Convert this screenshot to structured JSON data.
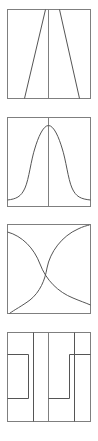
{
  "figure": {
    "background_color": "#ffffff",
    "panel_count": 4,
    "panel_width": 83,
    "panel_height": 89,
    "frame_color": "#7f7f7f",
    "curve_color": "#555555",
    "stroke_width": 1
  },
  "panels": [
    {
      "id": "panel-1",
      "name": "converging-straight-lines",
      "description": "Two straight diagonal lines converging toward the top, forming a narrow V-shaped taper with a vertical center axis",
      "shape_type": "straight-lines",
      "has_center_axis": true,
      "origin_x": 7,
      "origin_y": 9,
      "left_line": {
        "x_top": 38,
        "y_top": 0,
        "x_bottom": 17,
        "y_bottom": 89
      },
      "right_line": {
        "x_top": 52,
        "y_top": 0,
        "x_bottom": 72,
        "y_bottom": 89
      },
      "center_axis_x": 41.5
    },
    {
      "id": "panel-2",
      "name": "gaussian-bell-curve",
      "description": "A symmetric bell-shaped Gaussian curve peaking at the horizontal center near the top of the frame",
      "shape_type": "bell-curve",
      "has_center_axis": true,
      "origin_x": 7,
      "origin_y": 117,
      "peak_x": 41.5,
      "peak_y": 8,
      "baseline_y": 83,
      "center_axis_x": 41.5
    },
    {
      "id": "panel-3",
      "name": "pinwheel-s-curves",
      "description": "Two mirrored S-shaped curves crossing at the center of the frame, forming a pinwheel pattern connecting opposite corners",
      "shape_type": "s-curves",
      "has_center_axis": false,
      "origin_x": 7,
      "origin_y": 224,
      "crossing_x": 41.5,
      "crossing_y": 44.5,
      "curve_a": {
        "start_x": 0,
        "start_y": 8,
        "end_x": 83,
        "end_y": 81
      },
      "curve_b": {
        "start_x": 2,
        "start_y": 88,
        "end_x": 81,
        "end_y": 1
      }
    },
    {
      "id": "panel-4",
      "name": "rectilinear-step-brackets",
      "description": "Two mirrored rectilinear step or bracket shapes, one in each half of the frame, separated by a vertical center axis",
      "shape_type": "step-function",
      "has_center_axis": true,
      "origin_x": 7,
      "origin_y": 332,
      "center_axis_x": 41.5,
      "left_step": {
        "x_start": 0,
        "y_top": 22,
        "x_mid": 21,
        "y_bottom": 66,
        "x_end": 41
      },
      "right_step": {
        "x_start": 42,
        "y_top": 22,
        "x_mid": 62,
        "y_bottom": 66,
        "x_end": 83
      }
    }
  ]
}
